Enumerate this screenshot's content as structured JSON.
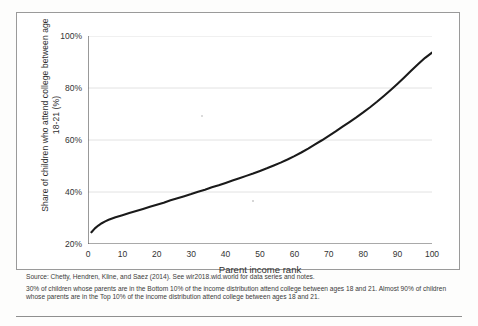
{
  "figure": {
    "y_axis_title": "Share of children who attend college between age 18-21 (%)",
    "x_axis_title": "Parent income rank",
    "source_line": "Source: Chetty, Hendren, Kline, and Saez (2014). See wir2018.wid.world for data series and notes.",
    "note_line": "30% of children whose parents are in the Bottom 10% of the income distribution attend college between ages 18 and 21. Almost 90% of children whose parents are in the Top 10% of the income distribution attend college between ages 18 and 21."
  },
  "chart_data": {
    "type": "line",
    "title": "",
    "xlabel": "Parent income rank",
    "ylabel": "Share of children who attend college between age 18-21 (%)",
    "xlim": [
      0,
      100
    ],
    "ylim": [
      20,
      100
    ],
    "xticks": [
      0,
      10,
      20,
      30,
      40,
      50,
      60,
      70,
      80,
      90,
      100
    ],
    "xtick_labels": [
      "0",
      "10",
      "20",
      "30",
      "40",
      "50",
      "60",
      "70",
      "80",
      "90",
      "100"
    ],
    "yticks": [
      20,
      40,
      60,
      80,
      100
    ],
    "ytick_labels": [
      "20%",
      "40%",
      "60%",
      "80%",
      "100%"
    ],
    "grid": "horizontal",
    "legend": "none",
    "line_color": "#1a1a1a",
    "series": [
      {
        "name": "Share attending college",
        "x": [
          1,
          2,
          3,
          4,
          5,
          6,
          7,
          8,
          9,
          10,
          12,
          14,
          16,
          18,
          20,
          22,
          24,
          26,
          28,
          30,
          32,
          34,
          36,
          38,
          40,
          42,
          44,
          46,
          48,
          50,
          52,
          54,
          56,
          58,
          60,
          62,
          64,
          66,
          68,
          70,
          72,
          74,
          76,
          78,
          80,
          82,
          84,
          86,
          88,
          90,
          92,
          94,
          96,
          98,
          100
        ],
        "values": [
          24.5,
          26.0,
          27.1,
          28.0,
          28.7,
          29.3,
          29.8,
          30.3,
          30.7,
          31.1,
          31.9,
          32.7,
          33.5,
          34.3,
          35.1,
          35.9,
          36.8,
          37.6,
          38.4,
          39.2,
          40.1,
          40.9,
          41.8,
          42.6,
          43.5,
          44.4,
          45.3,
          46.2,
          47.1,
          48.1,
          49.1,
          50.2,
          51.3,
          52.5,
          53.8,
          55.2,
          56.7,
          58.3,
          59.9,
          61.6,
          63.3,
          65.1,
          66.9,
          68.7,
          70.6,
          72.6,
          74.7,
          76.9,
          79.2,
          81.6,
          84.1,
          86.7,
          89.2,
          91.6,
          93.6
        ]
      }
    ],
    "annotations": [
      {
        "label": "Bottom 10% share",
        "value": 30
      },
      {
        "label": "Top 10% share",
        "value": 90
      }
    ]
  }
}
